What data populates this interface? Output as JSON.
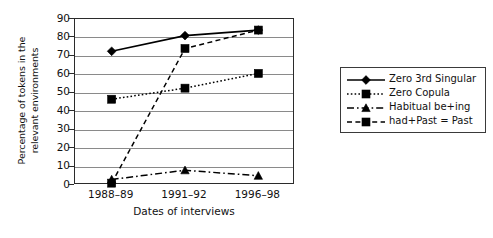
{
  "chart_data": {
    "type": "line",
    "title": "",
    "xlabel": "Dates of interviews",
    "ylabel": "Percentage of tokens in the relevant environments",
    "ylabel_line1": "Percentage of tokens in the",
    "ylabel_line2": "relevant environments",
    "categories": [
      "1988–89",
      "1991–92",
      "1996–98"
    ],
    "ylim": [
      0,
      90
    ],
    "yticks": [
      0,
      10,
      20,
      30,
      40,
      50,
      60,
      70,
      80,
      90
    ],
    "grid": "horizontal",
    "legend_position": "right",
    "series": [
      {
        "name": "Zero 3rd Singular",
        "values": [
          72.5,
          81,
          84
        ],
        "line_style": "solid",
        "marker": "diamond",
        "color": "#000000"
      },
      {
        "name": "Zero Copula",
        "values": [
          46.5,
          52.5,
          60.5
        ],
        "line_style": "dotted",
        "marker": "square",
        "color": "#000000"
      },
      {
        "name": "Habitual be+ing",
        "values": [
          3,
          8,
          5
        ],
        "line_style": "dashdot",
        "marker": "triangle",
        "color": "#000000"
      },
      {
        "name": "had+Past = Past",
        "values": [
          1,
          74,
          84
        ],
        "line_style": "dashed",
        "marker": "square",
        "color": "#000000"
      }
    ]
  },
  "legend": {
    "items": [
      {
        "label": "Zero 3rd Singular",
        "swatch": "solid-diamond-swatch"
      },
      {
        "label": "Zero Copula",
        "swatch": "dotted-square-swatch"
      },
      {
        "label": "Habitual be+ing",
        "swatch": "dashdot-triangle-swatch"
      },
      {
        "label": "had+Past = Past",
        "swatch": "dashed-square-swatch"
      }
    ]
  }
}
